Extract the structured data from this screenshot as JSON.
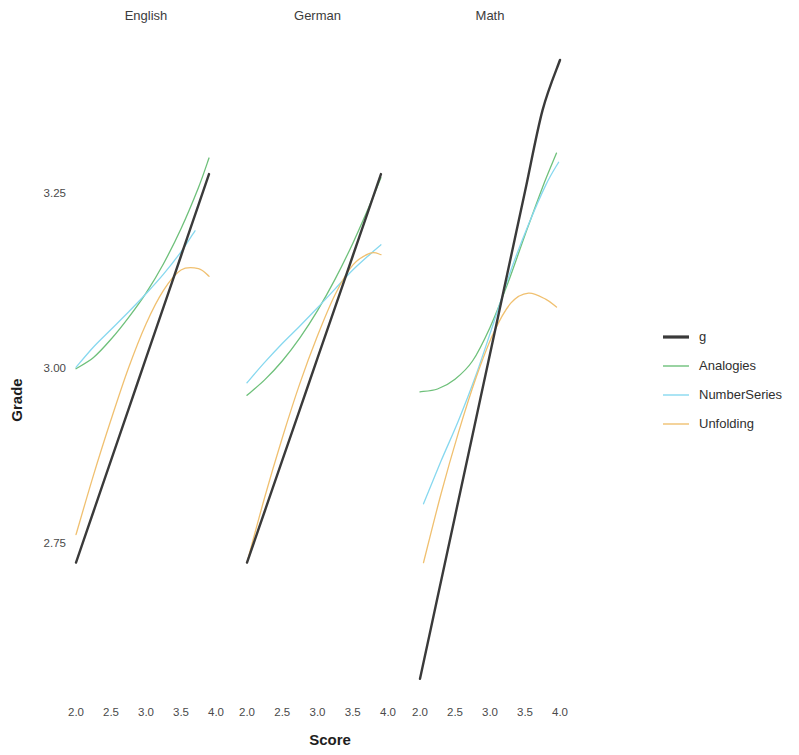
{
  "chart_data": {
    "type": "line",
    "title": "",
    "xlabel": "Score",
    "ylabel": "Grade",
    "facet_by": "Subject",
    "facets": [
      "English",
      "German",
      "Math"
    ],
    "xlim": [
      1.85,
      4.15
    ],
    "ylim": [
      2.55,
      3.42
    ],
    "xticks": [
      2.0,
      2.5,
      3.0,
      3.5,
      4.0
    ],
    "xticklabels": [
      "2.0",
      "2.5",
      "3.0",
      "3.5",
      "4.0"
    ],
    "yticks": [
      2.75,
      3.0,
      3.25
    ],
    "yticklabels": [
      "2.75",
      "3.00",
      "3.25"
    ],
    "grid": false,
    "legend_position": "right",
    "legend_title": "",
    "series_names": [
      "g",
      "Analogies",
      "NumberSeries",
      "Unfolding"
    ],
    "colors": {
      "g": "#3a3a3a",
      "Analogies": "#6ec07a",
      "NumberSeries": "#87d8ef",
      "Unfolding": "#f0c070"
    },
    "panels": [
      {
        "facet": "English",
        "series": [
          {
            "name": "g",
            "x": [
              2.0,
              2.25,
              2.5,
              2.75,
              3.0,
              3.25,
              3.5,
              3.75,
              3.9
            ],
            "y": [
              2.722,
              2.795,
              2.868,
              2.941,
              3.014,
              3.087,
              3.16,
              3.233,
              3.277
            ]
          },
          {
            "name": "Analogies",
            "x": [
              2.0,
              2.25,
              2.5,
              2.75,
              3.0,
              3.25,
              3.5,
              3.75,
              3.9
            ],
            "y": [
              2.999,
              3.015,
              3.041,
              3.072,
              3.107,
              3.149,
              3.199,
              3.258,
              3.3
            ]
          },
          {
            "name": "NumberSeries",
            "x": [
              2.0,
              2.25,
              2.5,
              2.75,
              3.0,
              3.25,
              3.5,
              3.7
            ],
            "y": [
              3.001,
              3.03,
              3.055,
              3.08,
              3.106,
              3.134,
              3.166,
              3.196
            ]
          },
          {
            "name": "Unfolding",
            "x": [
              2.0,
              2.25,
              2.5,
              2.75,
              3.0,
              3.25,
              3.5,
              3.75,
              3.9
            ],
            "y": [
              2.762,
              2.847,
              2.926,
              3.0,
              3.063,
              3.111,
              3.14,
              3.142,
              3.131
            ]
          }
        ]
      },
      {
        "facet": "German",
        "series": [
          {
            "name": "g",
            "x": [
              2.0,
              2.25,
              2.5,
              2.75,
              3.0,
              3.25,
              3.5,
              3.75,
              3.9
            ],
            "y": [
              2.722,
              2.795,
              2.868,
              2.941,
              3.014,
              3.087,
              3.16,
              3.233,
              3.277
            ]
          },
          {
            "name": "Analogies",
            "x": [
              2.0,
              2.25,
              2.5,
              2.75,
              3.0,
              3.25,
              3.5,
              3.75,
              3.9
            ],
            "y": [
              2.961,
              2.983,
              3.01,
              3.043,
              3.082,
              3.127,
              3.178,
              3.235,
              3.272
            ]
          },
          {
            "name": "NumberSeries",
            "x": [
              2.0,
              2.25,
              2.5,
              2.75,
              3.0,
              3.25,
              3.5,
              3.75,
              3.9
            ],
            "y": [
              2.979,
              3.008,
              3.035,
              3.06,
              3.086,
              3.113,
              3.14,
              3.163,
              3.176
            ]
          },
          {
            "name": "Unfolding",
            "x": [
              2.0,
              2.25,
              2.5,
              2.75,
              3.0,
              3.25,
              3.5,
              3.75,
              3.9
            ],
            "y": [
              2.722,
              2.815,
              2.9,
              2.978,
              3.046,
              3.105,
              3.147,
              3.164,
              3.162
            ]
          }
        ]
      },
      {
        "facet": "Math",
        "series": [
          {
            "name": "g",
            "x": [
              2.0,
              2.25,
              2.5,
              2.75,
              3.0,
              3.25,
              3.5,
              3.75,
              4.0
            ],
            "y": [
              2.556,
              2.672,
              2.788,
              2.904,
              3.02,
              3.136,
              3.252,
              3.368,
              3.44
            ]
          },
          {
            "name": "Analogies",
            "x": [
              2.0,
              2.25,
              2.5,
              2.75,
              3.0,
              3.25,
              3.5,
              3.75,
              3.95
            ],
            "y": [
              2.966,
              2.97,
              2.984,
              3.01,
              3.058,
              3.12,
              3.19,
              3.258,
              3.307
            ]
          },
          {
            "name": "NumberSeries",
            "x": [
              2.05,
              2.3,
              2.55,
              2.8,
              3.05,
              3.3,
              3.55,
              3.8,
              3.98
            ],
            "y": [
              2.806,
              2.867,
              2.925,
              2.99,
              3.064,
              3.14,
              3.205,
              3.262,
              3.294
            ]
          },
          {
            "name": "Unfolding",
            "x": [
              2.05,
              2.3,
              2.55,
              2.8,
              3.05,
              3.3,
              3.55,
              3.8,
              3.95
            ],
            "y": [
              2.722,
              2.82,
              2.908,
              2.986,
              3.05,
              3.093,
              3.107,
              3.098,
              3.087
            ]
          }
        ]
      }
    ]
  },
  "axes": {
    "y_title": "Grade",
    "x_title": "Score"
  },
  "legend": {
    "items": [
      {
        "label": "g",
        "color": "#3a3a3a",
        "width": 3.2
      },
      {
        "label": "Analogies",
        "color": "#6ec07a",
        "width": 1.4
      },
      {
        "label": "NumberSeries",
        "color": "#87d8ef",
        "width": 1.4
      },
      {
        "label": "Unfolding",
        "color": "#f0c070",
        "width": 1.4
      }
    ]
  },
  "strips": [
    {
      "label": "English"
    },
    {
      "label": "German"
    },
    {
      "label": "Math"
    }
  ],
  "y_ticks": [
    {
      "label": "3.25",
      "value": 3.25
    },
    {
      "label": "3.00",
      "value": 3.0
    },
    {
      "label": "2.75",
      "value": 2.75
    }
  ],
  "x_ticks": [
    {
      "label": "2.0",
      "value": 2.0
    },
    {
      "label": "2.5",
      "value": 2.5
    },
    {
      "label": "3.0",
      "value": 3.0
    },
    {
      "label": "3.5",
      "value": 3.5
    },
    {
      "label": "4.0",
      "value": 4.0
    }
  ]
}
